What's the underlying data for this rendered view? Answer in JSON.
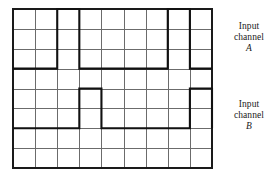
{
  "figure": {
    "background_color": "#ffffff",
    "grid": {
      "columns": 9,
      "rows": 8,
      "left": 13,
      "top": 9,
      "right": 212,
      "bottom": 168,
      "cell_width": 22.11,
      "cell_height": 19.88,
      "minor_line_color": "#6b6b6b",
      "border_color": "#1a1a1a",
      "minor_line_width": 1,
      "border_line_width": 1.6,
      "grid_visible": true
    },
    "trace_color": "#111111",
    "trace_line_width": 2.1
  },
  "labels": {
    "channel_a": {
      "line1": "Input",
      "line2": "channel",
      "name": "A"
    },
    "channel_b": {
      "line1": "Input",
      "line2": "channel",
      "name": "B"
    }
  },
  "chart_data": {
    "type": "line",
    "xlabel": "",
    "ylabel": "",
    "xlim": [
      0,
      9
    ],
    "ylim": [
      0,
      8
    ],
    "grid": true,
    "legend_position": "right",
    "x_unit": "grid divisions",
    "series": [
      {
        "name": "Input channel A",
        "label_lines": [
          "Input",
          "channel",
          "A"
        ],
        "low_level_row": 3,
        "high_level_row": 0,
        "idle_state": "low",
        "pulse_polarity": "positive",
        "pulses": [
          {
            "start": 2,
            "end": 3,
            "width": 1
          },
          {
            "start": 7,
            "end": 8,
            "width": 1
          }
        ],
        "points": [
          [
            0,
            3
          ],
          [
            2,
            3
          ],
          [
            2,
            0
          ],
          [
            3,
            0
          ],
          [
            3,
            3
          ],
          [
            7,
            3
          ],
          [
            7,
            0
          ],
          [
            8,
            0
          ],
          [
            8,
            3
          ],
          [
            9,
            3
          ]
        ]
      },
      {
        "name": "Input channel B",
        "label_lines": [
          "Input",
          "channel",
          "B"
        ],
        "low_level_row": 6,
        "high_level_row": 4,
        "idle_state": "low",
        "pulse_polarity": "positive",
        "pulses": [
          {
            "start": 3,
            "end": 4,
            "width": 1
          },
          {
            "start": 8,
            "end": 9,
            "width": 1
          }
        ],
        "points": [
          [
            0,
            6
          ],
          [
            3,
            6
          ],
          [
            3,
            4
          ],
          [
            4,
            4
          ],
          [
            4,
            6
          ],
          [
            8,
            6
          ],
          [
            8,
            4
          ],
          [
            9,
            4
          ],
          [
            9,
            6
          ]
        ]
      }
    ]
  }
}
